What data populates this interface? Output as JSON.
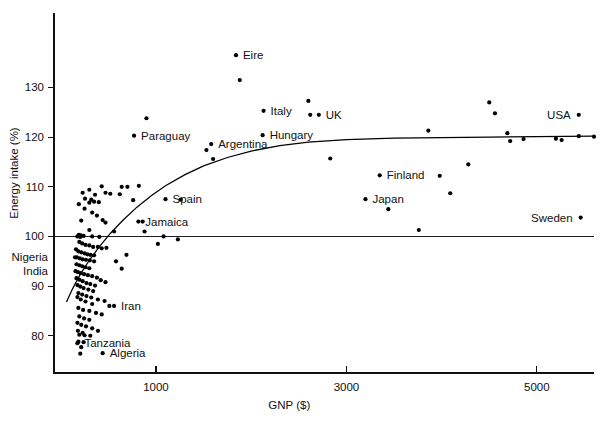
{
  "figure": {
    "kind": "scatter-plot",
    "background": "#ffffff",
    "ink_color": "#000000"
  },
  "chart_data": {
    "type": "scatter",
    "title": "",
    "subtitle": "",
    "xlabel": "GNP ($)",
    "ylabel": "Energy intake (%)",
    "xlim": [
      -71,
      5600
    ],
    "ylim": [
      72.5,
      145
    ],
    "grid": false,
    "legend": null,
    "x_ticks": [
      1000,
      3000,
      5000
    ],
    "x_tick_labels": [
      "1000",
      "3000",
      "5000"
    ],
    "y_ticks": [
      80,
      90,
      100,
      110,
      120,
      130
    ],
    "y_tick_labels": [
      "80",
      "90",
      "100",
      "110",
      "120",
      "130"
    ],
    "reference_lines": [
      {
        "name": "energy-intake-100-percent",
        "orientation": "horizontal",
        "y": 100
      }
    ],
    "fit_curve": {
      "name": "saturating-trend-curve",
      "description": "rising saturating curve through the cloud, levelling at about 120%",
      "points": [
        [
          60,
          86.8
        ],
        [
          120,
          89.3
        ],
        [
          200,
          92.2
        ],
        [
          300,
          95.2
        ],
        [
          400,
          97.8
        ],
        [
          520,
          100.6
        ],
        [
          650,
          103.2
        ],
        [
          800,
          105.9
        ],
        [
          950,
          108.2
        ],
        [
          1100,
          110.2
        ],
        [
          1300,
          112.4
        ],
        [
          1500,
          114.2
        ],
        [
          1750,
          115.9
        ],
        [
          2000,
          117.2
        ],
        [
          2300,
          118.3
        ],
        [
          2600,
          119.0
        ],
        [
          3000,
          119.5
        ],
        [
          3500,
          119.8
        ],
        [
          4000,
          119.9
        ],
        [
          4500,
          120.0
        ],
        [
          5000,
          120.1
        ],
        [
          5600,
          120.2
        ]
      ]
    },
    "labeled_points": [
      {
        "label": "Paraguay",
        "gnp": 770,
        "energy": 120.3,
        "label_side": "right"
      },
      {
        "label": "Argentina",
        "gnp": 1580,
        "energy": 118.6,
        "label_side": "right"
      },
      {
        "label": "Hungary",
        "gnp": 2120,
        "energy": 120.4,
        "label_side": "right"
      },
      {
        "label": "Eire",
        "gnp": 1840,
        "energy": 136.5,
        "label_side": "right"
      },
      {
        "label": "Italy",
        "gnp": 2130,
        "energy": 125.3,
        "label_side": "right"
      },
      {
        "label": "UK",
        "gnp": 2710,
        "energy": 124.5,
        "label_side": "right"
      },
      {
        "label": "USA",
        "gnp": 5440,
        "energy": 124.5,
        "label_side": "left"
      },
      {
        "label": "Spain",
        "gnp": 1100,
        "energy": 107.5,
        "label_side": "right"
      },
      {
        "label": "Jamaica",
        "gnp": 815,
        "energy": 103.0,
        "label_side": "right"
      },
      {
        "label": "Finland",
        "gnp": 3350,
        "energy": 112.3,
        "label_side": "right"
      },
      {
        "label": "Japan",
        "gnp": 3200,
        "energy": 107.5,
        "label_side": "right"
      },
      {
        "label": "Sweden",
        "gnp": 5460,
        "energy": 103.8,
        "label_side": "left"
      },
      {
        "label": "Nigeria",
        "gnp": 170,
        "energy": 95.8,
        "label_side": "axis-left"
      },
      {
        "label": "India",
        "gnp": 155,
        "energy": 93.0,
        "label_side": "axis-left"
      },
      {
        "label": "Iran",
        "gnp": 560,
        "energy": 86.0,
        "label_side": "right"
      },
      {
        "label": "Tanzania",
        "gnp": 175,
        "energy": 78.5,
        "label_side": "right"
      },
      {
        "label": "Algeria",
        "gnp": 440,
        "energy": 76.5,
        "label_side": "right"
      }
    ],
    "points": [
      [
        770,
        120.3
      ],
      [
        900,
        123.8
      ],
      [
        1580,
        118.6
      ],
      [
        2120,
        120.4
      ],
      [
        1840,
        136.5
      ],
      [
        1880,
        131.5
      ],
      [
        2130,
        125.3
      ],
      [
        2600,
        127.3
      ],
      [
        2620,
        124.5
      ],
      [
        2710,
        124.5
      ],
      [
        5440,
        124.5
      ],
      [
        1530,
        117.4
      ],
      [
        1600,
        115.6
      ],
      [
        2830,
        115.7
      ],
      [
        3980,
        112.2
      ],
      [
        4280,
        114.5
      ],
      [
        3350,
        112.3
      ],
      [
        3200,
        107.5
      ],
      [
        3860,
        121.3
      ],
      [
        4500,
        127.0
      ],
      [
        4560,
        124.8
      ],
      [
        5200,
        119.7
      ],
      [
        5260,
        119.4
      ],
      [
        5440,
        120.2
      ],
      [
        5600,
        120.1
      ],
      [
        4690,
        120.8
      ],
      [
        4720,
        119.2
      ],
      [
        4860,
        119.6
      ],
      [
        4090,
        108.7
      ],
      [
        5460,
        103.8
      ],
      [
        3440,
        105.5
      ],
      [
        3760,
        101.3
      ],
      [
        1100,
        107.5
      ],
      [
        1260,
        107.4
      ],
      [
        815,
        103.0
      ],
      [
        860,
        103.0
      ],
      [
        880,
        101.0
      ],
      [
        1080,
        100.0
      ],
      [
        1230,
        99.4
      ],
      [
        1020,
        98.5
      ],
      [
        820,
        110.2
      ],
      [
        640,
        110.0
      ],
      [
        700,
        110.0
      ],
      [
        430,
        110.1
      ],
      [
        300,
        109.4
      ],
      [
        230,
        108.8
      ],
      [
        360,
        108.4
      ],
      [
        470,
        108.8
      ],
      [
        520,
        108.6
      ],
      [
        620,
        108.5
      ],
      [
        255,
        107.6
      ],
      [
        320,
        107.4
      ],
      [
        400,
        106.9
      ],
      [
        300,
        106.8
      ],
      [
        350,
        107.0
      ],
      [
        760,
        107.3
      ],
      [
        190,
        106.5
      ],
      [
        250,
        105.6
      ],
      [
        330,
        104.8
      ],
      [
        380,
        104.2
      ],
      [
        440,
        103.3
      ],
      [
        470,
        102.8
      ],
      [
        560,
        101.0
      ],
      [
        300,
        101.3
      ],
      [
        215,
        103.2
      ],
      [
        190,
        100.3
      ],
      [
        210,
        100.2
      ],
      [
        240,
        100.1
      ],
      [
        175,
        100.0
      ],
      [
        205,
        99.9
      ],
      [
        330,
        100.0
      ],
      [
        405,
        99.9
      ],
      [
        195,
        98.9
      ],
      [
        225,
        98.6
      ],
      [
        260,
        98.3
      ],
      [
        300,
        98.2
      ],
      [
        340,
        97.9
      ],
      [
        390,
        97.9
      ],
      [
        430,
        97.6
      ],
      [
        480,
        97.7
      ],
      [
        160,
        97.4
      ],
      [
        185,
        97.0
      ],
      [
        215,
        96.8
      ],
      [
        250,
        96.6
      ],
      [
        280,
        96.4
      ],
      [
        310,
        96.3
      ],
      [
        350,
        96.2
      ],
      [
        150,
        95.8
      ],
      [
        170,
        95.8
      ],
      [
        200,
        95.6
      ],
      [
        230,
        95.4
      ],
      [
        265,
        95.3
      ],
      [
        305,
        95.2
      ],
      [
        350,
        95.0
      ],
      [
        690,
        96.3
      ],
      [
        580,
        95.0
      ],
      [
        165,
        94.4
      ],
      [
        195,
        94.2
      ],
      [
        225,
        94.0
      ],
      [
        260,
        93.8
      ],
      [
        300,
        93.6
      ],
      [
        155,
        93.0
      ],
      [
        180,
        92.8
      ],
      [
        210,
        92.6
      ],
      [
        245,
        92.4
      ],
      [
        285,
        92.2
      ],
      [
        330,
        92.0
      ],
      [
        380,
        91.7
      ],
      [
        640,
        93.5
      ],
      [
        420,
        91.2
      ],
      [
        470,
        90.8
      ],
      [
        165,
        91.6
      ],
      [
        195,
        91.3
      ],
      [
        230,
        91.0
      ],
      [
        270,
        90.6
      ],
      [
        310,
        90.4
      ],
      [
        360,
        90.1
      ],
      [
        175,
        90.2
      ],
      [
        205,
        89.9
      ],
      [
        240,
        89.6
      ],
      [
        290,
        89.3
      ],
      [
        340,
        89.0
      ],
      [
        185,
        88.6
      ],
      [
        225,
        88.3
      ],
      [
        270,
        88.0
      ],
      [
        320,
        87.7
      ],
      [
        390,
        87.3
      ],
      [
        460,
        87.0
      ],
      [
        175,
        87.8
      ],
      [
        210,
        87.3
      ],
      [
        260,
        86.9
      ],
      [
        330,
        86.4
      ],
      [
        560,
        86.0
      ],
      [
        510,
        86.0
      ],
      [
        185,
        85.6
      ],
      [
        235,
        85.2
      ],
      [
        300,
        85.0
      ],
      [
        370,
        84.6
      ],
      [
        430,
        84.3
      ],
      [
        195,
        83.9
      ],
      [
        245,
        83.5
      ],
      [
        300,
        83.2
      ],
      [
        175,
        82.6
      ],
      [
        215,
        82.2
      ],
      [
        265,
        81.9
      ],
      [
        330,
        81.5
      ],
      [
        390,
        81.0
      ],
      [
        180,
        81.0
      ],
      [
        230,
        80.6
      ],
      [
        195,
        80.2
      ],
      [
        250,
        80.1
      ],
      [
        310,
        80.0
      ],
      [
        185,
        78.8
      ],
      [
        175,
        78.5
      ],
      [
        240,
        78.7
      ],
      [
        215,
        77.7
      ],
      [
        440,
        76.5
      ],
      [
        205,
        76.4
      ]
    ]
  }
}
